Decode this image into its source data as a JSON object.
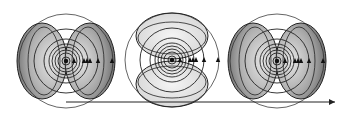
{
  "diagram": {
    "colors": {
      "line": "#222222",
      "lobe_fill_dark": "#8a8a8a",
      "lobe_fill_light": "#d9d9d9",
      "background": "#ffffff"
    },
    "figures": [
      {
        "id": "left",
        "cx": 66,
        "cy": 61,
        "lobe_orientation": "horizontal"
      },
      {
        "id": "center",
        "cx": 172,
        "cy": 60,
        "lobe_orientation": "vertical"
      },
      {
        "id": "right",
        "cx": 277,
        "cy": 61,
        "lobe_orientation": "horizontal"
      }
    ],
    "ring_radii": [
      4,
      8,
      11,
      14,
      17,
      22,
      32,
      47
    ],
    "marker_offsets": [
      8,
      18,
      21,
      24,
      32,
      46
    ],
    "arrow": {
      "x1": 66,
      "x2": 335,
      "y": 102
    }
  }
}
